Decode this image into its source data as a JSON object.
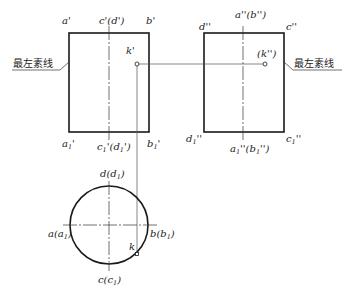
{
  "diagram": {
    "type": "orthographic-projection-cylinder",
    "front_view": {
      "top_labels": {
        "left": "a'",
        "center": "c'(d')",
        "right": "b'"
      },
      "bottom_labels": {
        "left": "a",
        "left_sub": "1",
        "left_tail": "'",
        "center": "c",
        "center_sub": "1",
        "center_tail": "'(d",
        "center_sub2": "1",
        "center_end": "')",
        "right": "b",
        "right_sub": "1",
        "right_tail": "'"
      },
      "point_label": "k'"
    },
    "side_view": {
      "top_labels": {
        "left": "d''",
        "center": "a''(b'')",
        "right": "c''"
      },
      "bottom_labels": {
        "left": "d",
        "left_sub": "1",
        "left_tail": "''",
        "center": "a",
        "center_sub": "1",
        "center_tail": "''(b",
        "center_sub2": "1",
        "center_end": "'')",
        "right": "c",
        "right_sub": "1",
        "right_tail": "''"
      },
      "point_label": "(k'')"
    },
    "top_view": {
      "top": "d(d",
      "top_sub": "1",
      "top_end": ")",
      "left": "a(a",
      "left_sub": "1",
      "left_end": ")",
      "right": "b(b",
      "right_sub": "1",
      "right_end": ")",
      "bottom": "c(c",
      "bottom_sub": "1",
      "bottom_end": ")",
      "point_label": "k"
    },
    "annotations": {
      "left_note": "最左素线",
      "right_note": "最左素线"
    },
    "colors": {
      "line": "#1a1a1a",
      "thin": "#555555",
      "background": "#ffffff"
    }
  }
}
